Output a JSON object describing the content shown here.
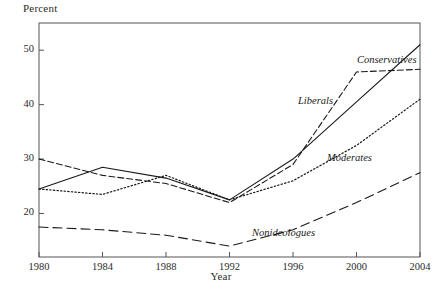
{
  "chart_data": {
    "type": "line",
    "title": "",
    "xlabel": "Year",
    "ylabel": "Percent",
    "x": [
      1980,
      1984,
      1988,
      1992,
      1996,
      2000,
      2004
    ],
    "xlim": [
      1980,
      2004
    ],
    "ylim": [
      12,
      55
    ],
    "yticks": [
      20,
      30,
      40,
      50
    ],
    "xticks": [
      1980,
      1984,
      1988,
      1992,
      1996,
      2000,
      2004
    ],
    "grid": false,
    "legend": "inline-annotations",
    "series": [
      {
        "name": "Conservatives",
        "style": "solid",
        "values": [
          24.5,
          28.5,
          26.5,
          22.5,
          30.0,
          40.5,
          51.0
        ]
      },
      {
        "name": "Liberals",
        "style": "dashed",
        "values": [
          30.0,
          27.0,
          25.5,
          22.0,
          29.0,
          46.0,
          46.5
        ]
      },
      {
        "name": "Moderates",
        "style": "dotted",
        "values": [
          24.5,
          23.5,
          27.0,
          22.5,
          26.0,
          32.5,
          41.0
        ]
      },
      {
        "name": "Nonideologues",
        "style": "long-dashed",
        "values": [
          17.5,
          17.0,
          16.0,
          14.0,
          17.0,
          22.0,
          27.5
        ]
      }
    ],
    "annotations": [
      {
        "text": "Conservatives",
        "x": 357,
        "y": 54
      },
      {
        "text": "Liberals",
        "x": 298,
        "y": 95
      },
      {
        "text": "Moderates",
        "x": 327,
        "y": 152
      },
      {
        "text": "Nonideologues",
        "x": 252,
        "y": 227
      }
    ],
    "yticklabels": [
      "20",
      "30",
      "40",
      "50"
    ],
    "xticklabels": [
      "1980",
      "1984",
      "1988",
      "1992",
      "1996",
      "2000",
      "2004"
    ]
  },
  "axes": {
    "x_title": "Year",
    "y_title": "Percent"
  },
  "colors": {
    "line": "#1a1a1a",
    "frame": "#555555",
    "background": "#ffffff"
  }
}
